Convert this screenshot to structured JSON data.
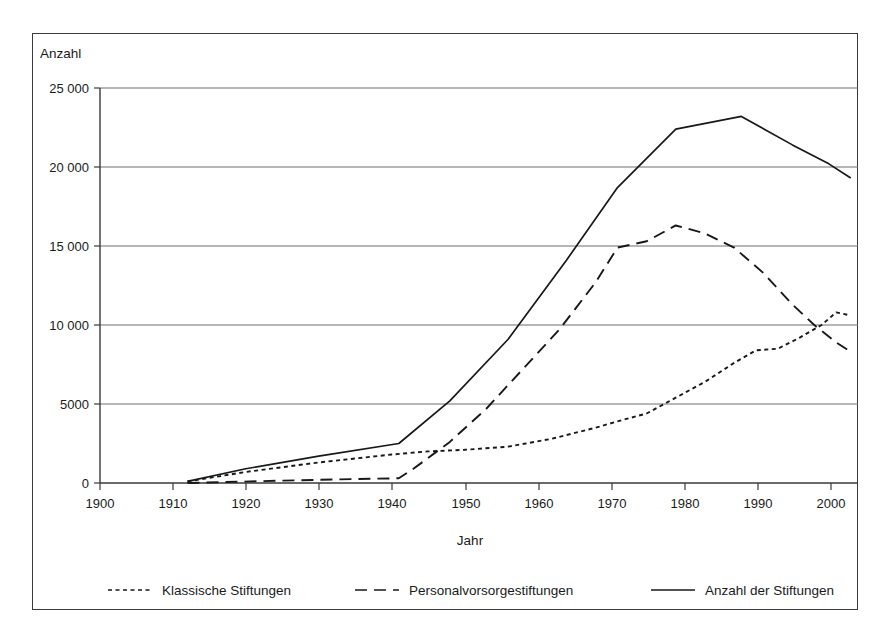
{
  "chart_data": {
    "type": "line",
    "title": "",
    "xlabel": "Jahr",
    "ylabel": "Anzahl",
    "xlim": [
      1900,
      2004
    ],
    "ylim": [
      0,
      25000
    ],
    "grid": true,
    "legend_position": "bottom",
    "xticks": [
      "1900",
      "1910",
      "1920",
      "1930",
      "1940",
      "1950",
      "1960",
      "1970",
      "1980",
      "1990",
      "2000"
    ],
    "xtick_values": [
      1900,
      1910,
      1920,
      1930,
      1940,
      1950,
      1960,
      1970,
      1980,
      1990,
      2000
    ],
    "yticks": [
      "0",
      "5000",
      "10 000",
      "15 000",
      "20 000",
      "25 000"
    ],
    "ytick_values": [
      0,
      5000,
      10000,
      15000,
      20000,
      25000
    ],
    "series": [
      {
        "name": "Klassische Stiftungen",
        "style": "dotted",
        "x": [
          1912,
          1920,
          1930,
          1940,
          1945,
          1950,
          1956,
          1962,
          1968,
          1971,
          1975,
          1979,
          1983,
          1987,
          1990,
          1993,
          1996,
          1999,
          2001,
          2003
        ],
        "values": [
          100,
          700,
          1300,
          1800,
          2000,
          2100,
          2300,
          2800,
          3500,
          3900,
          4400,
          5400,
          6400,
          7600,
          8400,
          8500,
          9200,
          10000,
          10800,
          10600
        ]
      },
      {
        "name": "Personalvorsorgestiftungen",
        "style": "dashed",
        "x": [
          1912,
          1925,
          1935,
          1941,
          1943,
          1948,
          1953,
          1958,
          1963,
          1968,
          1971,
          1975,
          1979,
          1983,
          1987,
          1991,
          1995,
          1998,
          2001,
          2003
        ],
        "values": [
          0,
          150,
          250,
          300,
          900,
          2600,
          4700,
          7200,
          9700,
          12700,
          14900,
          15300,
          16300,
          15800,
          14900,
          13300,
          11300,
          10000,
          8900,
          8300
        ]
      },
      {
        "name": "Anzahl der Stiftungen",
        "style": "solid",
        "x": [
          1912,
          1920,
          1930,
          1941,
          1948,
          1956,
          1964,
          1971,
          1979,
          1988,
          1995,
          2000,
          2003
        ],
        "values": [
          100,
          900,
          1700,
          2500,
          5200,
          9100,
          14100,
          18700,
          22400,
          23200,
          21400,
          20200,
          19300
        ]
      }
    ]
  },
  "legend": {
    "items": [
      {
        "label": "Klassische Stiftungen",
        "style": "dotted"
      },
      {
        "label": "Personalvorsorgestiftungen",
        "style": "dashed"
      },
      {
        "label": "Anzahl der Stiftungen",
        "style": "solid"
      }
    ]
  }
}
